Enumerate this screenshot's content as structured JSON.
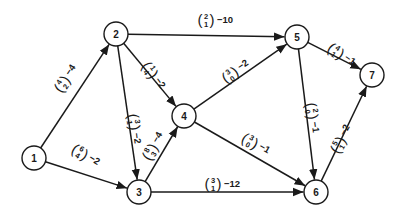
{
  "diagram": {
    "type": "directed-network",
    "node_radius": 12,
    "stroke_color": "#1a1a1a",
    "nodes": [
      {
        "id": "1",
        "label": "1",
        "x": 34,
        "y": 158
      },
      {
        "id": "2",
        "label": "2",
        "x": 116,
        "y": 34
      },
      {
        "id": "3",
        "label": "3",
        "x": 139,
        "y": 192
      },
      {
        "id": "4",
        "label": "4",
        "x": 184,
        "y": 116
      },
      {
        "id": "5",
        "label": "5",
        "x": 297,
        "y": 37
      },
      {
        "id": "6",
        "label": "6",
        "x": 316,
        "y": 192
      },
      {
        "id": "7",
        "label": "7",
        "x": 372,
        "y": 75
      }
    ],
    "edges": [
      {
        "from": "1",
        "to": "2",
        "top": "4",
        "bottom": "2",
        "cost": "−4",
        "lx": 62,
        "ly": 84,
        "angle": -56
      },
      {
        "from": "1",
        "to": "3",
        "top": "6",
        "bottom": "4",
        "cost": "−2",
        "lx": 80,
        "ly": 152,
        "angle": 32
      },
      {
        "from": "2",
        "to": "5",
        "top": "2",
        "bottom": "1",
        "cost": "−10",
        "lx": 206,
        "ly": 20,
        "angle": 0
      },
      {
        "from": "2",
        "to": "4",
        "top": "1",
        "bottom": "4",
        "cost": "−2",
        "lx": 150,
        "ly": 70,
        "angle": 55
      },
      {
        "from": "2",
        "to": "3",
        "top": "3",
        "bottom": "1",
        "cost": "−2",
        "lx": 134,
        "ly": 122,
        "angle": 83
      },
      {
        "from": "3",
        "to": "4",
        "top": "8",
        "bottom": "3",
        "cost": "−4",
        "lx": 150,
        "ly": 152,
        "angle": -60
      },
      {
        "from": "4",
        "to": "5",
        "top": "3",
        "bottom": "0",
        "cost": "−2",
        "lx": 230,
        "ly": 75,
        "angle": -35
      },
      {
        "from": "4",
        "to": "6",
        "top": "3",
        "bottom": "0",
        "cost": "−1",
        "lx": 250,
        "ly": 141,
        "angle": 30
      },
      {
        "from": "5",
        "to": "6",
        "top": "2",
        "bottom": "0",
        "cost": "−1",
        "lx": 312,
        "ly": 111,
        "angle": 82
      },
      {
        "from": "5",
        "to": "7",
        "top": "4",
        "bottom": "1",
        "cost": "−1",
        "lx": 336,
        "ly": 51,
        "angle": 35
      },
      {
        "from": "6",
        "to": "7",
        "top": "5",
        "bottom": "1",
        "cost": "−2",
        "lx": 338,
        "ly": 145,
        "angle": -62
      },
      {
        "from": "3",
        "to": "6",
        "top": "3",
        "bottom": "1",
        "cost": "−12",
        "lx": 213,
        "ly": 184,
        "angle": 0
      }
    ]
  }
}
